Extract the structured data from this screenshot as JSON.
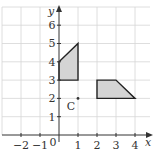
{
  "diagram": {
    "type": "coordinate-grid",
    "x_axis": {
      "label": "x",
      "min": -3,
      "max": 4,
      "tick_labels": [
        "−2",
        "−1",
        "0",
        "1",
        "2",
        "3",
        "4"
      ],
      "tick_values": [
        -2,
        -1,
        0,
        1,
        2,
        3,
        4
      ]
    },
    "y_axis": {
      "label": "y",
      "min": 0,
      "max": 7,
      "tick_labels": [
        "1",
        "2",
        "3",
        "4",
        "5",
        "6"
      ],
      "tick_values": [
        1,
        2,
        3,
        4,
        5,
        6
      ]
    },
    "shapes": [
      {
        "name": "shape-left",
        "vertices": [
          [
            0,
            3
          ],
          [
            1,
            3
          ],
          [
            1,
            5
          ],
          [
            0,
            4
          ]
        ],
        "fill": "#d4d4d4"
      },
      {
        "name": "shape-right",
        "vertices": [
          [
            2,
            2
          ],
          [
            4,
            2
          ],
          [
            3,
            3
          ],
          [
            2,
            3
          ]
        ],
        "fill": "#d4d4d4"
      }
    ],
    "points": [
      {
        "label": "C",
        "x": 1,
        "y": 2
      }
    ],
    "colors": {
      "grid": "#d6d6d6",
      "axis": "#333333",
      "shape_fill": "#d4d4d4",
      "shape_stroke": "#222222"
    }
  }
}
